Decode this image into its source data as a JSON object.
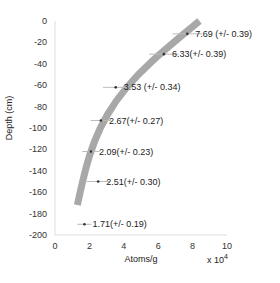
{
  "chart_data": {
    "type": "scatter",
    "title": "",
    "xlabel": "Atoms/g",
    "ylabel": "Depth (cm)",
    "x_multiplier_label": "x 10",
    "x_multiplier_exponent": "4",
    "xlim": [
      0,
      10
    ],
    "ylim": [
      -200,
      0
    ],
    "xticks": [
      "0",
      "2",
      "4",
      "6",
      "8",
      "10"
    ],
    "yticks": [
      "0",
      "-20",
      "-40",
      "-60",
      "-80",
      "-100",
      "-120",
      "-140",
      "-160",
      "-180",
      "-200"
    ],
    "grid": false,
    "series": [
      {
        "name": "measurements",
        "points": [
          {
            "x": 7.69,
            "y": -12,
            "err": 0.39,
            "label": "7.69 (+/- 0.39)"
          },
          {
            "x": 6.33,
            "y": -31,
            "err": 0.39,
            "label": "6.33(+/- 0.39)"
          },
          {
            "x": 3.53,
            "y": -62,
            "err": 0.34,
            "label": "3.53 (+/- 0.34)"
          },
          {
            "x": 2.67,
            "y": -93,
            "err": 0.27,
            "label": "2.67(+/- 0.27)"
          },
          {
            "x": 2.09,
            "y": -122,
            "err": 0.23,
            "label": "2.09(+/- 0.23)"
          },
          {
            "x": 2.51,
            "y": -150,
            "err": 0.3,
            "label": "2.51(+/- 0.30)"
          },
          {
            "x": 1.71,
            "y": -190,
            "err": 0.19,
            "label": "1.71(+/- 0.19)"
          }
        ]
      },
      {
        "name": "model-fit-band",
        "curve": [
          {
            "x": 8.4,
            "y": 0
          },
          {
            "x": 6.5,
            "y": -25
          },
          {
            "x": 4.8,
            "y": -50
          },
          {
            "x": 3.5,
            "y": -75
          },
          {
            "x": 2.6,
            "y": -100
          },
          {
            "x": 2.0,
            "y": -125
          },
          {
            "x": 1.6,
            "y": -150
          },
          {
            "x": 1.3,
            "y": -172
          }
        ]
      }
    ],
    "colors": {
      "band": "#999999",
      "marker": "#333333",
      "errbar": "#bbbbbb",
      "axis": "#dddddd"
    }
  }
}
